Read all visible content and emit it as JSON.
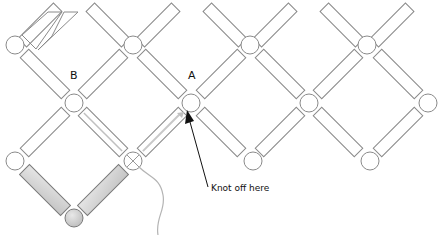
{
  "diagram": {
    "title": "",
    "labels": {
      "point_a": "A",
      "point_b": "B",
      "annotation": "Knot off here"
    },
    "colors": {
      "outline": "#8a8a8a",
      "filled_bead": "#d6d6d6",
      "filled_outline": "#7a7a7a",
      "thread": "#b4b4b4",
      "arrow": "#111111",
      "background": "#ffffff"
    },
    "elements": {
      "round_beads_top_row": 4,
      "round_beads_middle_row": 4,
      "round_beads_bottom_row": 4,
      "highlighted_round_bead": 1,
      "highlighted_bugle_beads": 2,
      "crossed_bead_count": 1
    }
  }
}
